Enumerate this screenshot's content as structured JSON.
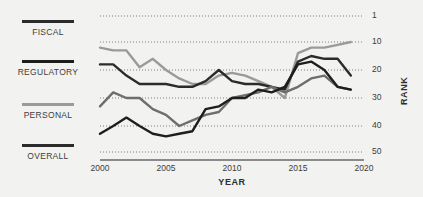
{
  "legend": {
    "items": [
      {
        "label": "FISCAL",
        "color": "#2b2b2b",
        "swatch_name": "legend-swatch-fiscal"
      },
      {
        "label": "REGULATORY",
        "color": "#1e1e1e",
        "swatch_name": "legend-swatch-regulatory"
      },
      {
        "label": "PERSONAL",
        "color": "#9a9a9a",
        "swatch_name": "legend-swatch-personal"
      },
      {
        "label": "OVERALL",
        "color": "#2b2b2b",
        "swatch_name": "legend-swatch-overall"
      }
    ]
  },
  "axes": {
    "x_title": "YEAR",
    "y_title": "RANK",
    "x_ticks": [
      "2000",
      "2005",
      "2010",
      "2015",
      "2020"
    ],
    "y_ticks": [
      "1",
      "10",
      "20",
      "30",
      "40",
      "50"
    ]
  },
  "chart_data": {
    "type": "line",
    "title": "",
    "xlabel": "YEAR",
    "ylabel": "RANK",
    "xlim": [
      2000,
      2020
    ],
    "ylim": [
      1,
      50
    ],
    "y_inverted": true,
    "grid": "horizontal-dotted",
    "legend_position": "left",
    "x": [
      2000,
      2001,
      2002,
      2003,
      2004,
      2005,
      2006,
      2007,
      2008,
      2009,
      2010,
      2011,
      2012,
      2013,
      2014,
      2015,
      2016,
      2017,
      2018,
      2019
    ],
    "x_tick_values": [
      2000,
      2005,
      2010,
      2015,
      2020
    ],
    "y_tick_values": [
      1,
      10,
      20,
      30,
      40,
      50
    ],
    "series": [
      {
        "name": "FISCAL",
        "color": "#9a9a9a",
        "values": [
          12,
          13,
          13,
          19,
          16,
          20,
          23,
          25,
          25,
          22,
          21,
          22,
          24,
          26,
          30,
          14,
          12,
          12,
          11,
          10
        ]
      },
      {
        "name": "REGULATORY",
        "color": "#2b2b2b",
        "values": [
          18,
          18,
          22,
          25,
          25,
          25,
          26,
          26,
          24,
          20,
          24,
          25,
          25,
          26,
          27,
          17,
          15,
          16,
          16,
          22
        ]
      },
      {
        "name": "PERSONAL",
        "color": "#6e6e6e",
        "values": [
          33,
          28,
          30,
          30,
          34,
          36,
          40,
          38,
          36,
          35,
          30,
          29,
          28,
          26,
          28,
          26,
          23,
          22,
          26,
          27
        ]
      },
      {
        "name": "OVERALL",
        "color": "#1e1e1e",
        "values": [
          43,
          40,
          37,
          40,
          43,
          44,
          43,
          42,
          34,
          33,
          30,
          30,
          27,
          28,
          26,
          18,
          17,
          20,
          26,
          27
        ]
      }
    ]
  }
}
